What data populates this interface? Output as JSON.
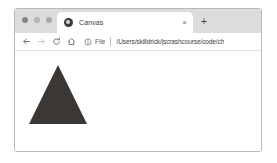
{
  "window": {
    "controls": [
      {
        "name": "close",
        "color": "#858585"
      },
      {
        "name": "minimize",
        "color": "#b5b5b5"
      },
      {
        "name": "maximize",
        "color": "#a8a8a8"
      }
    ]
  },
  "tab_strip": {
    "tabs": [
      {
        "title": "Canvas",
        "favicon": "globe-icon",
        "close_label": "×",
        "active": true
      }
    ],
    "new_tab_label": "+"
  },
  "toolbar": {
    "back_icon": "back-arrow-icon",
    "forward_icon": "forward-arrow-icon",
    "reload_icon": "reload-icon",
    "home_icon": "home-icon",
    "omnibox": {
      "security_icon": "info-circle-icon",
      "scheme_label": "File",
      "url": "/Users/skilldrick/jscrashcourse/code/ch"
    }
  },
  "page": {
    "shape": {
      "type": "triangle",
      "fill": "#3a3735",
      "apex": {
        "x": 43,
        "y": 14
      },
      "left": {
        "x": 14,
        "y": 73
      },
      "right": {
        "x": 72,
        "y": 73
      }
    }
  }
}
